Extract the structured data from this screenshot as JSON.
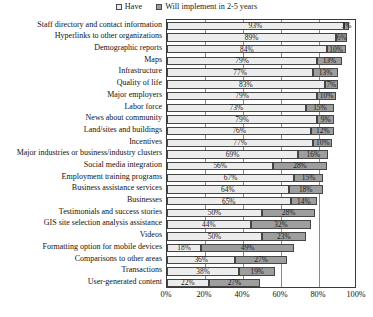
{
  "chart_data": {
    "type": "bar",
    "orientation": "horizontal",
    "stacked": true,
    "title": "",
    "xlabel": "",
    "ylabel": "",
    "xlim": [
      0,
      100
    ],
    "grid": true,
    "legend_position": "top-center",
    "xticks": [
      "0%",
      "20%",
      "40%",
      "60%",
      "80%",
      "100%"
    ],
    "xtick_values": [
      0,
      20,
      40,
      60,
      80,
      100
    ],
    "legend": [
      "Have",
      "Will implement in 2-5 years"
    ],
    "series": [
      {
        "name": "Have",
        "values": [
          93,
          89,
          84,
          79,
          77,
          83,
          79,
          73,
          79,
          76,
          77,
          69,
          56,
          67,
          64,
          65,
          50,
          44,
          50,
          18,
          36,
          38,
          22
        ]
      },
      {
        "name": "Will implement in 2-5 years",
        "values": [
          3,
          6,
          10,
          13,
          13,
          7,
          10,
          15,
          9,
          12,
          10,
          16,
          28,
          15,
          18,
          14,
          28,
          32,
          23,
          49,
          27,
          19,
          27
        ]
      }
    ],
    "categories": [
      "Staff directory and contact information",
      "Hyperlinks to other organizations",
      "Demographic reports",
      "Maps",
      "Infrastructure",
      "Quality of life",
      "Major employers",
      "Labor force",
      "News about community",
      "Land/sites and buildings",
      "Incentives",
      "Major industries or business/industry clusters",
      "Social media integration",
      "Employment training programs",
      "Business assistance services",
      "Businesses",
      "Testimonials and success stories",
      "GIS site selection analysis assistance",
      "Videos",
      "Formatting option for mobile devices",
      "Comparisons to other areas",
      "Transactions",
      "User-generated content"
    ],
    "data_labels": [
      {
        "have": "93%",
        "will": "3%"
      },
      {
        "have": "89%",
        "will": "6%"
      },
      {
        "have": "84%",
        "will": "10%"
      },
      {
        "have": "79%",
        "will": "13%"
      },
      {
        "have": "77%",
        "will": "13%"
      },
      {
        "have": "83%",
        "will": "7%"
      },
      {
        "have": "79%",
        "will": "10%"
      },
      {
        "have": "73%",
        "will": "15%"
      },
      {
        "have": "79%",
        "will": "9%"
      },
      {
        "have": "76%",
        "will": "12%"
      },
      {
        "have": "77%",
        "will": "10%"
      },
      {
        "have": "69%",
        "will": "16%"
      },
      {
        "have": "56%",
        "will": "28%"
      },
      {
        "have": "67%",
        "will": "15%"
      },
      {
        "have": "64%",
        "will": "18%"
      },
      {
        "have": "65%",
        "will": "14%"
      },
      {
        "have": "50%",
        "will": "28%"
      },
      {
        "have": "44%",
        "will": "32%"
      },
      {
        "have": "50%",
        "will": "23%"
      },
      {
        "have": "18%",
        "will": "49%"
      },
      {
        "have": "36%",
        "will": "27%"
      },
      {
        "have": "38%",
        "will": "19%"
      },
      {
        "have": "22%",
        "will": "27%"
      }
    ],
    "colors": {
      "have": "#ececec",
      "will": "#9e9e9e",
      "border": "#454545",
      "axis": "#3a3a3a",
      "grid": "#8a8a8a",
      "text": "#111111"
    }
  }
}
